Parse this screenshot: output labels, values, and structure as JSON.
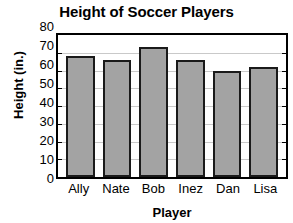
{
  "chart_data": {
    "type": "bar",
    "title": "Height of Soccer Players",
    "xlabel": "Player",
    "ylabel": "Height (in.)",
    "categories": [
      "Ally",
      "Nate",
      "Bob",
      "Inez",
      "Dan",
      "Lisa"
    ],
    "values": [
      68,
      66,
      73,
      66,
      60,
      62
    ],
    "ylim": [
      0,
      80
    ],
    "ytick_step": 10,
    "yticks": [
      80,
      70,
      60,
      50,
      40,
      30,
      20,
      10,
      0
    ],
    "grid": true,
    "legend": false,
    "bar_color": "#a3a3a3",
    "bar_edge_color": "#1a1a1a",
    "gridline_color": "#c9c9c9",
    "axis_color": "#000000",
    "background_color": "#ffffff"
  }
}
